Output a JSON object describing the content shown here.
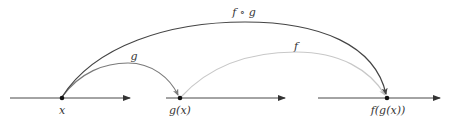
{
  "diagram": {
    "axes": [
      {
        "id": "domain-axis",
        "x1": 10,
        "x2": 130,
        "y": 98
      },
      {
        "id": "middle-axis",
        "x1": 166,
        "x2": 285,
        "y": 98
      },
      {
        "id": "codomain-axis",
        "x1": 318,
        "x2": 440,
        "y": 98
      }
    ],
    "points": [
      {
        "id": "x",
        "label": "x",
        "cx": 62,
        "cy": 98
      },
      {
        "id": "gx",
        "label": "g(x)",
        "cx": 180,
        "cy": 98
      },
      {
        "id": "fgx",
        "label": "f(g(x))",
        "cx": 387,
        "cy": 98
      }
    ],
    "arrows": [
      {
        "id": "g",
        "label": "g",
        "from": "x",
        "to": "g(x)",
        "color": "#7a7a7a"
      },
      {
        "id": "f",
        "label": "f",
        "from": "g(x)",
        "to": "f(g(x))",
        "color": "#c8c8c8"
      },
      {
        "id": "fog",
        "label": "f ∘ g",
        "from": "x",
        "to": "f(g(x))",
        "color": "#444444"
      }
    ],
    "colors": {
      "axis": "#333333",
      "point": "#111111",
      "text": "#333333"
    }
  }
}
